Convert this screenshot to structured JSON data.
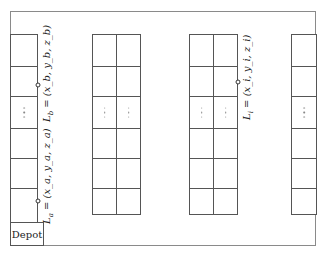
{
  "diagram": {
    "type": "warehouse-layout",
    "colors": {
      "line": "#555555",
      "border": "#8a8a8a",
      "background": "#ffffff"
    },
    "racks": [
      {
        "id": "rack-1",
        "columns": 1,
        "rows": 6,
        "ellipsis_row": 3
      },
      {
        "id": "rack-2",
        "columns": 2,
        "rows": 6,
        "ellipsis_row": 3
      },
      {
        "id": "rack-3",
        "columns": 2,
        "rows": 6,
        "ellipsis_row": 3
      },
      {
        "id": "rack-4",
        "columns": 1,
        "rows": 6,
        "ellipsis_row": 3
      }
    ],
    "locations": [
      {
        "name": "L_b",
        "symbol": "L",
        "sub": "b",
        "coords": "= (x_b, y_b, z_b)",
        "rack": "rack-1"
      },
      {
        "name": "L_a",
        "symbol": "L",
        "sub": "a",
        "coords": "= (x_a, y_a, z_a)",
        "rack": "rack-1"
      },
      {
        "name": "L_i",
        "symbol": "L",
        "sub": "i",
        "coords": "= (x_i, y_i, z_i)",
        "rack": "rack-3"
      }
    ],
    "depot": {
      "label": "Depot"
    }
  }
}
